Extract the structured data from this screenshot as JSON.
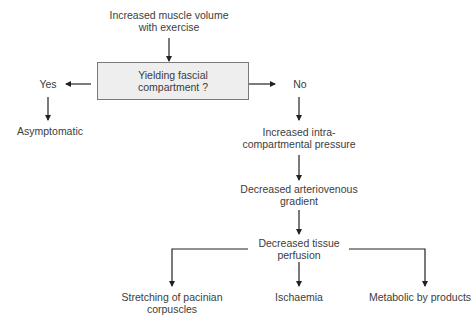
{
  "diagram": {
    "start": {
      "line1": "Increased muscle volume",
      "line2": "with exercise"
    },
    "decision": {
      "line1": "Yielding fascial",
      "line2": "compartment ?"
    },
    "branch_yes": {
      "label": "Yes",
      "outcome": "Asymptomatic"
    },
    "branch_no": {
      "label": "No"
    },
    "chain": [
      {
        "line1": "Increased intra-",
        "line2": "compartmental pressure"
      },
      {
        "line1": "Decreased arteriovenous",
        "line2": "gradient"
      },
      {
        "line1": "Decreased tissue",
        "line2": "perfusion"
      }
    ],
    "outcomes": [
      {
        "line1": "Stretching of pacinian",
        "line2": "corpuscles"
      },
      {
        "line1": "Ischaemia",
        "line2": ""
      },
      {
        "line1": "Metabolic by products",
        "line2": ""
      }
    ],
    "colors": {
      "box_fill": "#eeeeee",
      "box_border": "#7a7a7a",
      "line": "#222222",
      "text": "#3c3c3c"
    }
  }
}
